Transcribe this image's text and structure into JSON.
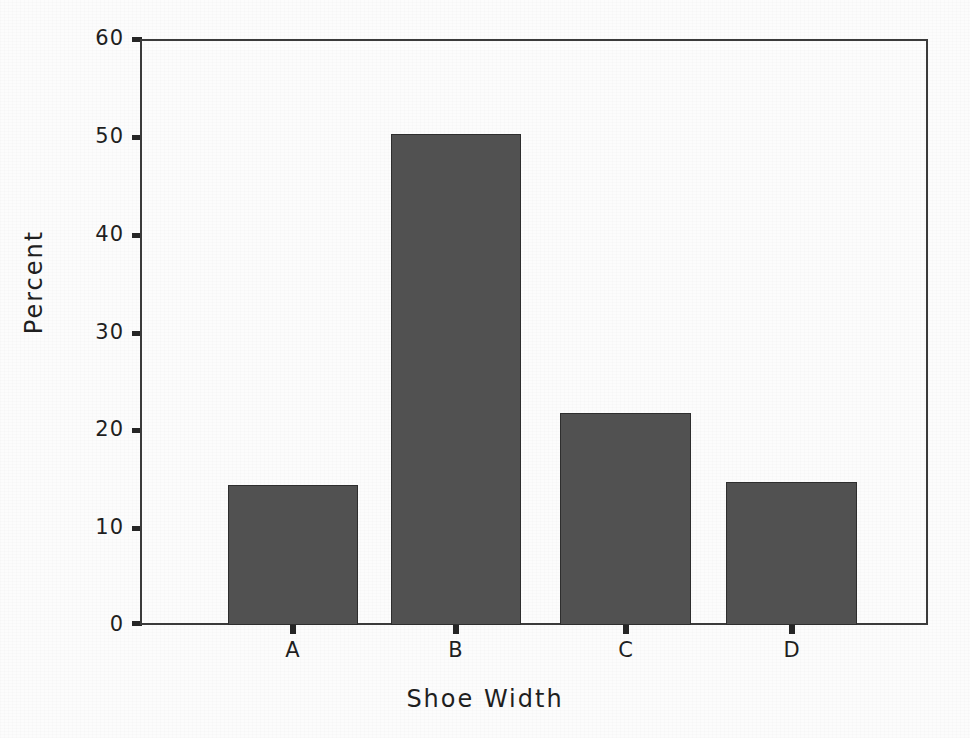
{
  "chart_data": {
    "type": "bar",
    "title": "",
    "xlabel": "Shoe Width",
    "ylabel": "Percent",
    "categories": [
      "A",
      "B",
      "C",
      "D"
    ],
    "values": [
      14.3,
      50.3,
      21.7,
      14.6
    ],
    "ylim": [
      0,
      60
    ],
    "ytick_labels": [
      "0",
      "10",
      "20",
      "30",
      "40",
      "50",
      "60"
    ],
    "ytick_values": [
      0,
      10,
      20,
      30,
      40,
      50,
      60
    ],
    "grid": false,
    "legend": false,
    "legend_position": "none",
    "bar_color": "#515151",
    "bar_edge_color": "#2e2e2e",
    "axis_color": "#3a3a3a",
    "background_color": "#fcfcfc"
  }
}
